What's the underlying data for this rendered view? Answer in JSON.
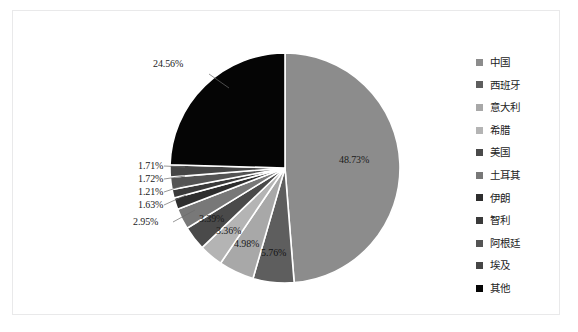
{
  "chart_data": {
    "type": "pie",
    "title": "",
    "categories": [
      "中国",
      "西班牙",
      "意大利",
      "希腊",
      "美国",
      "土耳其",
      "伊朗",
      "智利",
      "阿根廷",
      "埃及",
      "其他"
    ],
    "values": [
      48.73,
      5.76,
      4.98,
      3.36,
      3.39,
      2.95,
      1.63,
      1.21,
      1.72,
      1.71,
      24.56
    ],
    "value_labels": [
      "48.73%",
      "5.76%",
      "4.98%",
      "3.36%",
      "3.39%",
      "2.95%",
      "1.63%",
      "1.21%",
      "1.72%",
      "1.71%",
      "24.56%"
    ],
    "colors": [
      "#8c8c8c",
      "#5e5e5e",
      "#a8a8a8",
      "#b4b4b4",
      "#4a4a4a",
      "#787878",
      "#2e2e2e",
      "#3a3a3a",
      "#545454",
      "#464646",
      "#050505"
    ],
    "legend_position": "right",
    "start_angle": 0,
    "direction": "clockwise",
    "grid": false,
    "xlabel": "",
    "ylabel": ""
  },
  "legend": {
    "items": [
      {
        "label": "中国",
        "color": "#8c8c8c"
      },
      {
        "label": "西班牙",
        "color": "#5e5e5e"
      },
      {
        "label": "意大利",
        "color": "#a8a8a8"
      },
      {
        "label": "希腊",
        "color": "#b4b4b4"
      },
      {
        "label": "美国",
        "color": "#4a4a4a"
      },
      {
        "label": "土耳其",
        "color": "#787878"
      },
      {
        "label": "伊朗",
        "color": "#2e2e2e"
      },
      {
        "label": "智利",
        "color": "#3a3a3a"
      },
      {
        "label": "阿根廷",
        "color": "#545454"
      },
      {
        "label": "埃及",
        "color": "#464646"
      },
      {
        "label": "其他",
        "color": "#050505"
      }
    ]
  },
  "labels": {
    "china": "48.73%",
    "spain": "5.76%",
    "italy": "4.98%",
    "greece": "3.36%",
    "usa": "3.39%",
    "turkey": "2.95%",
    "iran": "1.63%",
    "chile": "1.21%",
    "argentina": "1.72%",
    "egypt": "1.71%",
    "other": "24.56%"
  }
}
